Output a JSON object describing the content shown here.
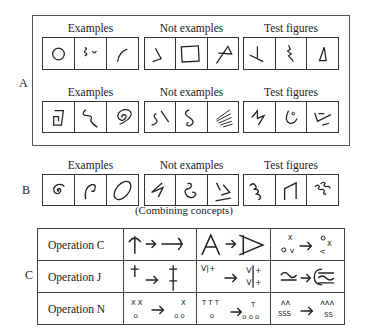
{
  "panel_a": {
    "label": "A",
    "rows": [
      {
        "headers": [
          "Examples",
          "Not examples",
          "Test figures"
        ],
        "groups": [
          {
            "name": "examples",
            "figures": [
              "circle",
              "squiggle-and-cup",
              "arc"
            ]
          },
          {
            "name": "not-examples",
            "figures": [
              "open-angle",
              "square",
              "crossed-loop"
            ]
          },
          {
            "name": "test-figures",
            "figures": [
              "inverted-t-angle",
              "zigzag-squiggle",
              "triangle"
            ]
          }
        ]
      },
      {
        "headers": [
          "Examples",
          "Not examples",
          "Test figures"
        ],
        "groups": [
          {
            "name": "examples",
            "figures": [
              "square-spiral",
              "wavy-line",
              "round-spiral"
            ]
          },
          {
            "name": "not-examples",
            "figures": [
              "s-curve-and-slash",
              "double-hook",
              "parallel-lines"
            ]
          },
          {
            "name": "test-figures",
            "figures": [
              "zigzag",
              "hook-with-dot",
              "angle-with-dashes"
            ]
          }
        ]
      }
    ]
  },
  "panel_b": {
    "label": "B",
    "headers": [
      "Examples",
      "Not examples",
      "Test figures"
    ],
    "groups": [
      {
        "name": "examples",
        "figures": [
          "spiral",
          "hook-curve",
          "ellipse"
        ]
      },
      {
        "name": "not-examples",
        "figures": [
          "lightning",
          "double-curl",
          "chevron-and-line"
        ]
      },
      {
        "name": "test-figures",
        "figures": [
          "wiggle",
          "open-trapezoid",
          "double-wiggle"
        ]
      }
    ],
    "caption": "(Combining concepts)"
  },
  "panel_c": {
    "label": "C",
    "operations": [
      {
        "name": "Operation C",
        "examples": [
          "T-rotate",
          "A-rotate",
          "xov-rotate"
        ]
      },
      {
        "name": "Operation J",
        "examples": [
          "dagger-duplicate",
          "v-plus-duplicate",
          "tilde-duplicate"
        ]
      },
      {
        "name": "Operation N",
        "examples": [
          {
            "before_top": "X X",
            "before_bottom": "o",
            "after_top": "X",
            "after_bottom": "o o"
          },
          {
            "before_top": "T T T",
            "before_bottom": "o",
            "after_top": "T",
            "after_bottom": "o o o"
          },
          {
            "before_top": "ᴧᴧ",
            "before_bottom": "SSS",
            "after_top": "ᴧᴧᴧ",
            "after_bottom": "SS"
          }
        ]
      }
    ],
    "glyphs": {
      "x": "X",
      "o": "o",
      "v": "v",
      "lt": "<",
      "plus": "+",
      "t": "T"
    }
  },
  "colors": {
    "ink": "#222222",
    "frame": "#555555",
    "background": "#ffffff"
  }
}
